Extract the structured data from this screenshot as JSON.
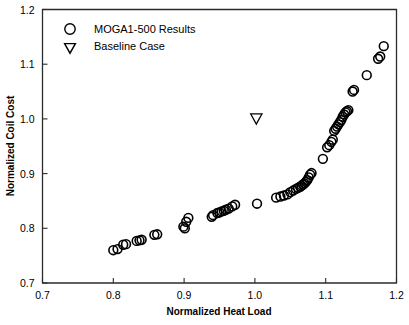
{
  "chart_data": {
    "type": "scatter",
    "title": "",
    "xlabel": "Normalized Heat Load",
    "ylabel": "Normalized Coil Cost",
    "xlim": [
      0.7,
      1.2
    ],
    "ylim": [
      0.7,
      1.2
    ],
    "xticks": [
      "0.7",
      "0.8",
      "0.9",
      "1.0",
      "1.1",
      "1.2"
    ],
    "yticks": [
      "0.7",
      "0.8",
      "0.9",
      "1.0",
      "1.1",
      "1.2"
    ],
    "xtick_values": [
      0.7,
      0.8,
      0.9,
      1.0,
      1.1,
      1.2
    ],
    "ytick_values": [
      0.7,
      0.8,
      0.9,
      1.0,
      1.1,
      1.2
    ],
    "grid": false,
    "legend_position": "top-left",
    "series": [
      {
        "name": "MOGA1-500  Results",
        "marker": "circle",
        "points": [
          [
            0.8,
            0.76
          ],
          [
            0.806,
            0.762
          ],
          [
            0.814,
            0.77
          ],
          [
            0.818,
            0.771
          ],
          [
            0.833,
            0.777
          ],
          [
            0.837,
            0.778
          ],
          [
            0.84,
            0.779
          ],
          [
            0.858,
            0.788
          ],
          [
            0.862,
            0.789
          ],
          [
            0.899,
            0.803
          ],
          [
            0.901,
            0.8
          ],
          [
            0.903,
            0.812
          ],
          [
            0.906,
            0.819
          ],
          [
            0.939,
            0.821
          ],
          [
            0.941,
            0.824
          ],
          [
            0.947,
            0.828
          ],
          [
            0.95,
            0.829
          ],
          [
            0.953,
            0.831
          ],
          [
            0.956,
            0.832
          ],
          [
            0.959,
            0.834
          ],
          [
            0.963,
            0.836
          ],
          [
            0.968,
            0.84
          ],
          [
            0.972,
            0.843
          ],
          [
            1.003,
            0.845
          ],
          [
            1.03,
            0.856
          ],
          [
            1.036,
            0.858
          ],
          [
            1.041,
            0.86
          ],
          [
            1.046,
            0.862
          ],
          [
            1.05,
            0.866
          ],
          [
            1.054,
            0.869
          ],
          [
            1.058,
            0.872
          ],
          [
            1.061,
            0.874
          ],
          [
            1.064,
            0.876
          ],
          [
            1.066,
            0.878
          ],
          [
            1.068,
            0.88
          ],
          [
            1.07,
            0.882
          ],
          [
            1.072,
            0.885
          ],
          [
            1.074,
            0.888
          ],
          [
            1.076,
            0.893
          ],
          [
            1.078,
            0.898
          ],
          [
            1.08,
            0.901
          ],
          [
            1.096,
            0.927
          ],
          [
            1.102,
            0.948
          ],
          [
            1.105,
            0.952
          ],
          [
            1.108,
            0.958
          ],
          [
            1.11,
            0.962
          ],
          [
            1.112,
            0.978
          ],
          [
            1.114,
            0.982
          ],
          [
            1.116,
            0.986
          ],
          [
            1.118,
            0.99
          ],
          [
            1.12,
            0.994
          ],
          [
            1.122,
            0.998
          ],
          [
            1.124,
            1.004
          ],
          [
            1.126,
            1.008
          ],
          [
            1.128,
            1.012
          ],
          [
            1.13,
            1.014
          ],
          [
            1.132,
            1.016
          ],
          [
            1.138,
            1.05
          ],
          [
            1.14,
            1.053
          ],
          [
            1.158,
            1.08
          ],
          [
            1.174,
            1.11
          ],
          [
            1.177,
            1.114
          ],
          [
            1.182,
            1.133
          ]
        ]
      },
      {
        "name": "Baseline Case",
        "marker": "triangle-down",
        "points": [
          [
            1.002,
            1.0
          ]
        ]
      }
    ],
    "legend_entries": [
      {
        "label": "MOGA1-500  Results",
        "marker": "circle"
      },
      {
        "label": "Baseline Case",
        "marker": "triangle-down"
      }
    ],
    "colors": {
      "marker_stroke": "#000000",
      "axis": "#2b2b2b",
      "background": "#ffffff"
    }
  }
}
